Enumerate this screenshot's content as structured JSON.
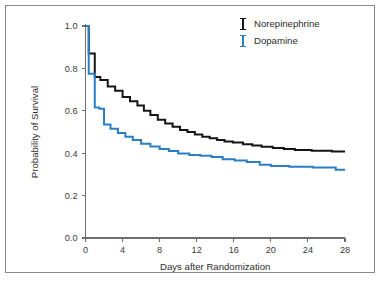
{
  "figure": {
    "border_color": "#8a8a8a",
    "background": "#ffffff"
  },
  "chart_data": {
    "type": "line",
    "subtype": "kaplan-meier-step",
    "title": "",
    "xlabel": "Days after Randomization",
    "ylabel": "Probability of Survival",
    "xlim": [
      0,
      28
    ],
    "ylim": [
      0.0,
      1.0
    ],
    "xticks": [
      0,
      4,
      8,
      12,
      16,
      20,
      24,
      28
    ],
    "xtick_labels": [
      "0",
      "4",
      "8",
      "12",
      "16",
      "20",
      "24",
      "28"
    ],
    "yticks": [
      0.0,
      0.2,
      0.4,
      0.6,
      0.8,
      1.0
    ],
    "ytick_labels": [
      "0.0",
      "0.2",
      "0.4",
      "0.6",
      "0.8",
      "1.0"
    ],
    "grid": false,
    "legend_position": "top-right",
    "series": [
      {
        "name": "Norepinephrine",
        "color": "#151515",
        "marker": "I-bar",
        "x": [
          0.0,
          0.35,
          0.35,
          1.0,
          1.0,
          1.6,
          1.6,
          2.4,
          2.4,
          3.2,
          3.2,
          4.0,
          4.0,
          4.8,
          4.8,
          5.6,
          5.6,
          6.3,
          6.3,
          7.0,
          7.0,
          7.8,
          7.8,
          8.6,
          8.6,
          9.4,
          9.4,
          10.2,
          10.2,
          11.0,
          11.0,
          11.8,
          11.8,
          12.6,
          12.6,
          13.4,
          13.4,
          14.2,
          14.2,
          15.0,
          15.0,
          15.9,
          15.9,
          17.0,
          17.0,
          18.0,
          18.0,
          19.0,
          19.0,
          20.2,
          20.2,
          21.4,
          21.4,
          22.6,
          22.6,
          24.4,
          24.4,
          26.6,
          26.6,
          28.0
        ],
        "y": [
          1.0,
          1.0,
          0.87,
          0.87,
          0.76,
          0.76,
          0.745,
          0.745,
          0.715,
          0.715,
          0.695,
          0.695,
          0.665,
          0.665,
          0.645,
          0.645,
          0.625,
          0.625,
          0.6,
          0.6,
          0.58,
          0.58,
          0.558,
          0.558,
          0.54,
          0.54,
          0.525,
          0.525,
          0.51,
          0.51,
          0.5,
          0.5,
          0.488,
          0.488,
          0.478,
          0.478,
          0.47,
          0.47,
          0.462,
          0.462,
          0.455,
          0.455,
          0.45,
          0.45,
          0.442,
          0.442,
          0.436,
          0.436,
          0.43,
          0.43,
          0.425,
          0.425,
          0.42,
          0.42,
          0.415,
          0.415,
          0.412,
          0.412,
          0.408,
          0.408
        ],
        "start_value": 1.0,
        "end_value": 0.41
      },
      {
        "name": "Dopamine",
        "color": "#2b7ec6",
        "marker": "I-bar",
        "x": [
          0.0,
          0.35,
          0.35,
          1.0,
          1.0,
          1.5,
          1.5,
          2.0,
          2.0,
          2.7,
          2.7,
          3.5,
          3.5,
          4.3,
          4.3,
          5.1,
          5.1,
          6.0,
          6.0,
          7.0,
          7.0,
          8.0,
          8.0,
          9.0,
          9.0,
          10.0,
          10.0,
          11.2,
          11.2,
          12.4,
          12.4,
          13.6,
          13.6,
          14.8,
          14.8,
          16.1,
          16.1,
          17.4,
          17.4,
          18.8,
          18.8,
          20.0,
          20.0,
          22.0,
          22.0,
          24.5,
          24.5,
          27.0,
          27.0,
          28.0
        ],
        "y": [
          1.0,
          1.0,
          0.775,
          0.775,
          0.615,
          0.615,
          0.61,
          0.61,
          0.535,
          0.535,
          0.515,
          0.515,
          0.495,
          0.495,
          0.478,
          0.478,
          0.462,
          0.462,
          0.445,
          0.445,
          0.432,
          0.432,
          0.42,
          0.42,
          0.41,
          0.41,
          0.398,
          0.398,
          0.392,
          0.392,
          0.388,
          0.388,
          0.382,
          0.382,
          0.372,
          0.372,
          0.366,
          0.366,
          0.358,
          0.358,
          0.345,
          0.345,
          0.34,
          0.34,
          0.336,
          0.336,
          0.332,
          0.332,
          0.322,
          0.322
        ],
        "start_value": 1.0,
        "end_value": 0.32
      }
    ]
  },
  "legend": {
    "items": [
      {
        "label": "Norepinephrine",
        "color": "#151515"
      },
      {
        "label": "Dopamine",
        "color": "#2b7ec6"
      }
    ]
  }
}
